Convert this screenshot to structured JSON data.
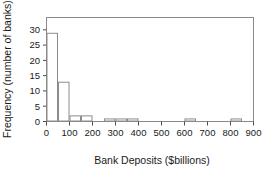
{
  "chart_data": {
    "type": "bar",
    "title": "",
    "subtitle": "",
    "xlabel": "Bank Deposits ($billions)",
    "ylabel": "Frequency (number of banks)",
    "xlim": [
      0,
      900
    ],
    "ylim": [
      0,
      34
    ],
    "grid": false,
    "legend": null,
    "bin_width": 50,
    "bin_edges": [
      0,
      50,
      100,
      150,
      200,
      250,
      300,
      350,
      400,
      450,
      500,
      550,
      600,
      650,
      700,
      750,
      800,
      850,
      900
    ],
    "categories": [
      "0-50",
      "50-100",
      "100-150",
      "150-200",
      "200-250",
      "250-300",
      "300-350",
      "350-400",
      "400-450",
      "450-500",
      "500-550",
      "550-600",
      "600-650",
      "650-700",
      "700-750",
      "750-800",
      "800-850",
      "850-900"
    ],
    "values": [
      29,
      13,
      2,
      2,
      0,
      1,
      1,
      1,
      0,
      0,
      0,
      0,
      1,
      0,
      0,
      0,
      1,
      0
    ],
    "xticks": [
      0,
      100,
      200,
      300,
      400,
      500,
      600,
      700,
      800,
      900
    ],
    "xtick_labels": [
      "0",
      "100",
      "200",
      "300",
      "400",
      "500",
      "600",
      "700",
      "800",
      "900"
    ],
    "yticks": [
      0,
      5,
      10,
      15,
      20,
      25,
      30
    ],
    "ytick_labels": [
      "0",
      "5",
      "10",
      "15",
      "20",
      "25",
      "30"
    ],
    "bar_fill": "#ffffff",
    "bar_stroke": "#8c8c8c",
    "frame_color": "#8a8a8a",
    "text_color": "#1a1a1a",
    "background": "#ffffff"
  }
}
